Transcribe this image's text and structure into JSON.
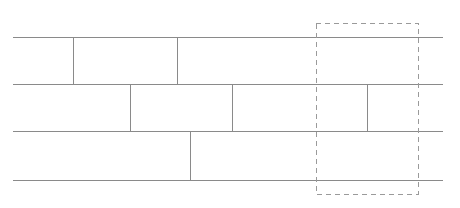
{
  "diagram": {
    "type": "line-diagram",
    "canvas": {
      "width": 460,
      "height": 208,
      "background": "#ffffff"
    },
    "style": {
      "solid_line_color": "#8a8a8a",
      "solid_line_width": 1,
      "dashed_line_color": "#9a9a9a",
      "dashed_line_width": 1,
      "dash_pattern": "5,4"
    },
    "extent": {
      "left": 13,
      "right": 443,
      "top": 37,
      "bottom": 180
    },
    "course_lines": [
      {
        "name": "course-line-top",
        "y": 37,
        "x1": 13,
        "x2": 443
      },
      {
        "name": "course-line-second",
        "y": 84,
        "x1": 13,
        "x2": 443
      },
      {
        "name": "course-line-third",
        "y": 131,
        "x1": 13,
        "x2": 443
      },
      {
        "name": "course-line-bottom",
        "y": 180,
        "x1": 13,
        "x2": 443
      }
    ],
    "joint_lines": [
      {
        "name": "joint-row1-a",
        "x": 73,
        "y1": 37,
        "y2": 84
      },
      {
        "name": "joint-row1-b",
        "x": 177,
        "y1": 37,
        "y2": 84
      },
      {
        "name": "joint-row2-a",
        "x": 130,
        "y1": 84,
        "y2": 131
      },
      {
        "name": "joint-row2-b",
        "x": 232,
        "y1": 84,
        "y2": 131
      },
      {
        "name": "joint-row2-c",
        "x": 367,
        "y1": 84,
        "y2": 131
      },
      {
        "name": "joint-row3-a",
        "x": 190,
        "y1": 131,
        "y2": 180
      }
    ],
    "selection_region": {
      "name": "dashed-selection-rectangle",
      "x": 316,
      "y": 23,
      "width": 102,
      "height": 171
    }
  }
}
